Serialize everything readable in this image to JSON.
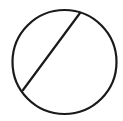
{
  "diagram": {
    "type": "geometry",
    "shapes": [
      {
        "kind": "circle",
        "name": "circle",
        "cx": 64.5,
        "cy": 62,
        "r": 52
      },
      {
        "kind": "chord",
        "name": "chord",
        "x1": 80,
        "y1": 13,
        "x2": 23,
        "y2": 90
      }
    ],
    "stroke_color": "#1a1a1a",
    "stroke_width": 2.2,
    "background": "#ffffff"
  }
}
